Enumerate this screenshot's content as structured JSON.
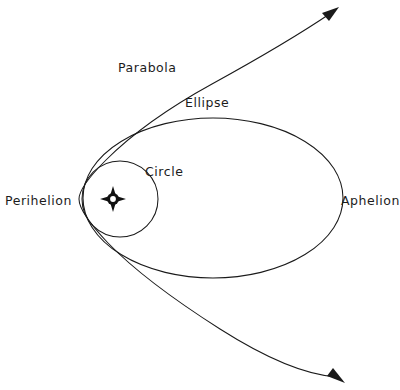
{
  "diagram": {
    "background_color": "#ffffff",
    "stroke_color": "#1a1a1a",
    "labels": {
      "parabola": "Parabola",
      "ellipse": "Ellipse",
      "circle": "Circle",
      "perihelion": "Perihelion",
      "aphelion": "Aphelion"
    },
    "icons": {
      "sun": "sun-icon",
      "arrow_upper": "arrowhead-icon",
      "arrow_lower": "arrowhead-icon"
    },
    "geometry": {
      "sun_center": [
        113,
        199
      ],
      "perihelion_point": [
        80,
        199
      ],
      "circle_center": [
        120,
        199
      ],
      "circle_radius": 38,
      "ellipse_center": [
        213,
        198
      ],
      "ellipse_semi_major": 130,
      "ellipse_semi_minor": 80,
      "aphelion_point": [
        343,
        198
      ],
      "parabola_vertex": [
        79,
        199
      ],
      "parabola_upper_tip": [
        337,
        8
      ],
      "parabola_lower_tip": [
        343,
        382
      ]
    }
  }
}
